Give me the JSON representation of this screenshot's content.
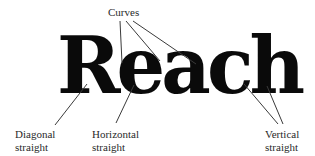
{
  "figure": {
    "word": "Reach",
    "labels": {
      "curves": "Curves",
      "diagonal_line1": "Diagonal",
      "diagonal_line2": "straight",
      "horizontal_line1": "Horizontal",
      "horizontal_line2": "straight",
      "vertical_line1": "Vertical",
      "vertical_line2": "straight"
    },
    "colors": {
      "background": "#ffffff",
      "word": "#0a0a0a",
      "leader_lines": "#3a3a3a",
      "label_text": "#2a2a2a"
    }
  }
}
